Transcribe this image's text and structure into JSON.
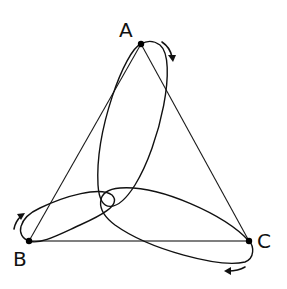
{
  "diagram": {
    "title": "",
    "vertices": [
      {
        "id": "A",
        "label": "A"
      },
      {
        "id": "B",
        "label": "B"
      },
      {
        "id": "C",
        "label": "C"
      }
    ],
    "edges": [
      {
        "from": "A",
        "to": "B"
      },
      {
        "from": "A",
        "to": "C"
      },
      {
        "from": "B",
        "to": "C"
      }
    ],
    "loops": [
      {
        "vertex": "A",
        "direction": "clockwise"
      },
      {
        "vertex": "B",
        "direction": "clockwise"
      },
      {
        "vertex": "C",
        "direction": "clockwise"
      }
    ],
    "colors": {
      "line": "#111111",
      "background": "#ffffff"
    }
  }
}
